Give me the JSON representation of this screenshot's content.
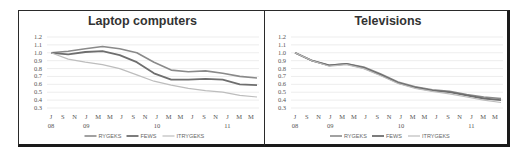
{
  "chart_data": [
    {
      "type": "line",
      "title": "Laptop computers",
      "xlabel": "",
      "ylabel": "",
      "ylim": [
        0.3,
        1.2
      ],
      "yticks": [
        "1.2",
        "1.1",
        "1.0",
        "0.9",
        "0.8",
        "0.7",
        "0.6",
        "0.5",
        "0.4",
        "0.3"
      ],
      "x_month_labels": [
        "J",
        "S",
        "N",
        "J",
        "M",
        "M",
        "J",
        "S",
        "N",
        "J",
        "M",
        "M",
        "J",
        "S",
        "N",
        "J",
        "M",
        "M"
      ],
      "x_year_labels": [
        {
          "label": "08",
          "at": 0
        },
        {
          "label": "09",
          "at": 3
        },
        {
          "label": "10",
          "at": 9
        },
        {
          "label": "11",
          "at": 15
        }
      ],
      "grid": true,
      "legend_position": "bottom",
      "note": "Lines are monochrome gray; series-to-line mapping is inferred from stroke weight/position, not confirmed from a color legend. Values are coarse approximations.",
      "series": [
        {
          "name": "RYGEKS",
          "values": [
            1.0,
            1.02,
            1.05,
            1.08,
            1.05,
            1.0,
            0.88,
            0.78,
            0.76,
            0.77,
            0.74,
            0.7,
            0.68
          ],
          "color": "#8a8a8a",
          "width": 1.6
        },
        {
          "name": "FEWS",
          "values": [
            1.0,
            0.98,
            1.01,
            1.02,
            0.97,
            0.88,
            0.74,
            0.66,
            0.66,
            0.67,
            0.66,
            0.6,
            0.59
          ],
          "color": "#6e6e6e",
          "width": 1.8
        },
        {
          "name": "ITRYGEKS",
          "values": [
            1.0,
            0.92,
            0.88,
            0.85,
            0.8,
            0.72,
            0.64,
            0.59,
            0.55,
            0.52,
            0.5,
            0.46,
            0.44
          ],
          "color": "#bdbdbd",
          "width": 1.2
        }
      ]
    },
    {
      "type": "line",
      "title": "Televisions",
      "xlabel": "",
      "ylabel": "",
      "ylim": [
        0.3,
        1.2
      ],
      "yticks": [
        "1.2",
        "1.1",
        "1.0",
        "0.9",
        "0.8",
        "0.7",
        "0.6",
        "0.5",
        "0.4",
        "0.3"
      ],
      "x_month_labels": [
        "J",
        "S",
        "N",
        "J",
        "M",
        "M",
        "J",
        "S",
        "N",
        "J",
        "M",
        "M",
        "J",
        "S",
        "N",
        "J",
        "M",
        "M"
      ],
      "x_year_labels": [
        {
          "label": "08",
          "at": 0
        },
        {
          "label": "09",
          "at": 3
        },
        {
          "label": "10",
          "at": 9
        },
        {
          "label": "11",
          "at": 15
        }
      ],
      "grid": true,
      "legend_position": "bottom",
      "note": "Lines are monochrome gray and nearly overlap; series-to-line mapping is inferred, not confirmed. Values are coarse approximations.",
      "series": [
        {
          "name": "RYGEKS",
          "values": [
            1.0,
            0.9,
            0.84,
            0.86,
            0.82,
            0.73,
            0.63,
            0.57,
            0.53,
            0.51,
            0.47,
            0.44,
            0.42
          ],
          "color": "#8a8a8a",
          "width": 1.6
        },
        {
          "name": "FEWS",
          "values": [
            1.0,
            0.9,
            0.84,
            0.86,
            0.81,
            0.72,
            0.62,
            0.56,
            0.52,
            0.5,
            0.46,
            0.42,
            0.4
          ],
          "color": "#6e6e6e",
          "width": 1.8
        },
        {
          "name": "ITRYGEKS",
          "values": [
            1.0,
            0.9,
            0.83,
            0.85,
            0.8,
            0.71,
            0.61,
            0.55,
            0.51,
            0.48,
            0.44,
            0.4,
            0.37
          ],
          "color": "#bdbdbd",
          "width": 1.2
        }
      ]
    }
  ],
  "legend": [
    "RYGEKS",
    "FEWS",
    "ITRYGEKS"
  ]
}
